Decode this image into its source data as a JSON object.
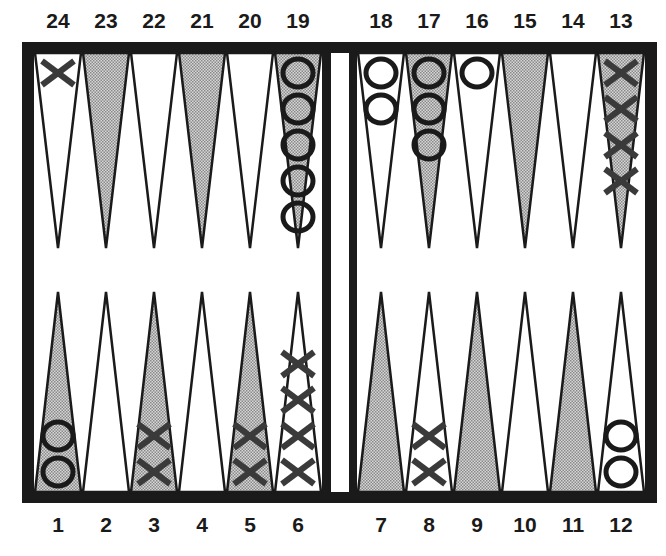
{
  "colors": {
    "frame": "#1a1a1a",
    "dark_point": "#b8b8b8",
    "light_point": "#ffffff",
    "checker_x": "#3a3a3a",
    "checker_o": "#1a1a1a"
  },
  "top_labels": [
    "24",
    "23",
    "22",
    "21",
    "20",
    "19",
    "18",
    "17",
    "16",
    "15",
    "14",
    "13"
  ],
  "bottom_labels": [
    "1",
    "2",
    "3",
    "4",
    "5",
    "6",
    "7",
    "8",
    "9",
    "10",
    "11",
    "12"
  ],
  "points": [
    {
      "point": 1,
      "shade": "dark",
      "checker": "O",
      "count": 2
    },
    {
      "point": 2,
      "shade": "light",
      "checker": "",
      "count": 0
    },
    {
      "point": 3,
      "shade": "dark",
      "checker": "X",
      "count": 2
    },
    {
      "point": 4,
      "shade": "light",
      "checker": "",
      "count": 0
    },
    {
      "point": 5,
      "shade": "dark",
      "checker": "X",
      "count": 2
    },
    {
      "point": 6,
      "shade": "light",
      "checker": "X",
      "count": 4
    },
    {
      "point": 7,
      "shade": "dark",
      "checker": "",
      "count": 0
    },
    {
      "point": 8,
      "shade": "light",
      "checker": "X",
      "count": 2
    },
    {
      "point": 9,
      "shade": "dark",
      "checker": "",
      "count": 0
    },
    {
      "point": 10,
      "shade": "light",
      "checker": "",
      "count": 0
    },
    {
      "point": 11,
      "shade": "dark",
      "checker": "",
      "count": 0
    },
    {
      "point": 12,
      "shade": "light",
      "checker": "O",
      "count": 2
    },
    {
      "point": 13,
      "shade": "dark",
      "checker": "X",
      "count": 4
    },
    {
      "point": 14,
      "shade": "light",
      "checker": "",
      "count": 0
    },
    {
      "point": 15,
      "shade": "dark",
      "checker": "",
      "count": 0
    },
    {
      "point": 16,
      "shade": "light",
      "checker": "O",
      "count": 1
    },
    {
      "point": 17,
      "shade": "dark",
      "checker": "O",
      "count": 3
    },
    {
      "point": 18,
      "shade": "light",
      "checker": "O",
      "count": 2
    },
    {
      "point": 19,
      "shade": "dark",
      "checker": "O",
      "count": 5
    },
    {
      "point": 20,
      "shade": "light",
      "checker": "",
      "count": 0
    },
    {
      "point": 21,
      "shade": "dark",
      "checker": "",
      "count": 0
    },
    {
      "point": 22,
      "shade": "light",
      "checker": "",
      "count": 0
    },
    {
      "point": 23,
      "shade": "dark",
      "checker": "",
      "count": 0
    },
    {
      "point": 24,
      "shade": "light",
      "checker": "X",
      "count": 1
    }
  ]
}
